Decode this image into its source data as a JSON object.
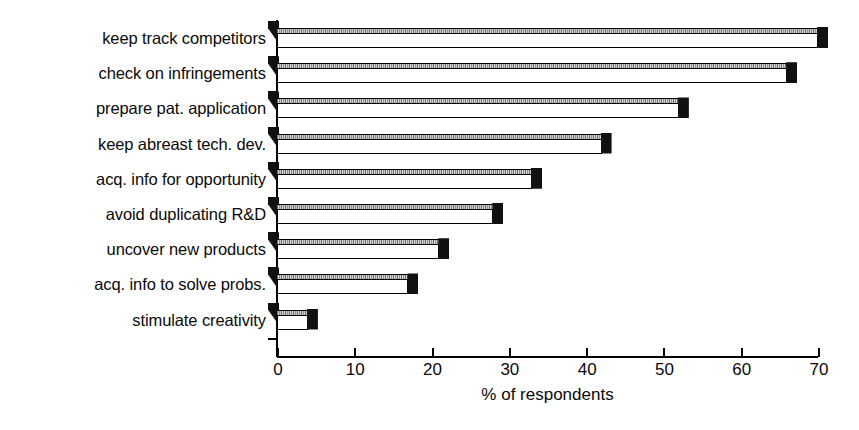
{
  "chart_data": {
    "type": "bar",
    "orientation": "horizontal",
    "title": "",
    "xlabel": "% of respondents",
    "ylabel": "",
    "xlim": [
      0,
      70
    ],
    "xticks": [
      0,
      10,
      20,
      30,
      40,
      50,
      60,
      70
    ],
    "xtick_labels": [
      "0",
      "10",
      "20",
      "30",
      "40",
      "50",
      "60",
      "70"
    ],
    "grid": false,
    "legend": false,
    "categories": [
      "keep track competitors",
      "check on infringements",
      "prepare pat. application",
      "keep abreast tech. dev.",
      "acq. info for opportunity",
      "avoid duplicating R&D",
      "uncover new products",
      "acq. info to solve probs.",
      "stimulate creativity"
    ],
    "values": [
      70,
      66,
      52,
      42,
      33,
      28,
      21,
      17,
      4
    ],
    "series": [
      {
        "name": "% of respondents",
        "values": [
          70,
          66,
          52,
          42,
          33,
          28,
          21,
          17,
          4
        ]
      }
    ],
    "bar_style": "3d-horizontal",
    "colors": {
      "bar_front": "#ffffff",
      "bar_top": "#8c8c8c",
      "bar_edge": "#000000",
      "axis": "#000000",
      "text": "#0a0a0a",
      "background": "#ffffff"
    }
  }
}
